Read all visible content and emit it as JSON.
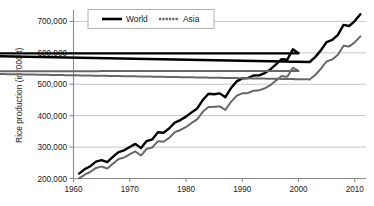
{
  "chart_data": {
    "type": "line",
    "title": "",
    "xlabel": "",
    "ylabel": "Rice production (in '000 t)",
    "xlim": [
      1960,
      2012
    ],
    "ylim": [
      200000,
      730000
    ],
    "yticks": [
      200000,
      300000,
      400000,
      500000,
      600000,
      700000
    ],
    "ytick_labels": [
      "200,000",
      "300,000",
      "400,000",
      "500,000",
      "600,000",
      "700,000"
    ],
    "xticks": [
      1960,
      1970,
      1980,
      1990,
      2000,
      2010
    ],
    "xtick_labels": [
      "1960",
      "1970",
      "1980",
      "1990",
      "2000",
      "2010"
    ],
    "grid": true,
    "grid_axis": "y",
    "legend_position": "top-center",
    "x": [
      1961,
      1962,
      1963,
      1964,
      1965,
      1966,
      1967,
      1968,
      1969,
      1970,
      1971,
      1972,
      1973,
      1974,
      1975,
      1976,
      1977,
      1978,
      1979,
      1980,
      1981,
      1982,
      1983,
      1984,
      1985,
      1986,
      1987,
      1988,
      1989,
      1990,
      1991,
      1992,
      1993,
      1994,
      1995,
      1996,
      1997,
      1998,
      1999,
      2000,
      1920,
      2002,
      2003,
      2004,
      2005,
      2006,
      2007,
      2008,
      2009,
      2010,
      2011
    ],
    "series": [
      {
        "name": "World",
        "color": "#000000",
        "line_style": "solid",
        "line_width": 2.4,
        "values": [
          215600,
          229800,
          239200,
          253800,
          258300,
          252000,
          268600,
          283900,
          289800,
          300500,
          310300,
          296700,
          319000,
          324300,
          347200,
          345800,
          359000,
          378000,
          385900,
          396900,
          410500,
          423000,
          450200,
          469600,
          468200,
          471000,
          458700,
          487800,
          509000,
          518600,
          519400,
          527900,
          528400,
          535600,
          547200,
          563000,
          579900,
          578000,
          611100,
          598800,
          597900,
          570800,
          587100,
          608700,
          634400,
          641300,
          657300,
          688900,
          685500,
          701100,
          722800
        ]
      },
      {
        "name": "Asia",
        "color": "#666666",
        "line_style": "dotted-thick",
        "line_width": 2.0,
        "values": [
          200300,
          212400,
          221100,
          233700,
          238100,
          231800,
          247100,
          261600,
          267000,
          277100,
          286400,
          272800,
          294000,
          298600,
          318500,
          317200,
          329100,
          347300,
          354200,
          363700,
          376800,
          388500,
          412800,
          427900,
          428000,
          429500,
          418300,
          443800,
          463400,
          471100,
          471900,
          479400,
          480600,
          487200,
          497000,
          512000,
          526100,
          523600,
          552600,
          542400,
          541000,
          515500,
          529900,
          549700,
          572800,
          578800,
          593700,
          622400,
          620300,
          633500,
          652300
        ]
      }
    ]
  },
  "legend": {
    "items": [
      {
        "label": "World"
      },
      {
        "label": "Asia"
      }
    ]
  },
  "colors": {
    "world_line": "#000000",
    "asia_line": "#666666",
    "gridline": "#c9c9c9",
    "axis": "#8a8a8a",
    "text": "#1a1a1a",
    "background": "#ffffff",
    "legend_border": "#b0b0b0"
  }
}
